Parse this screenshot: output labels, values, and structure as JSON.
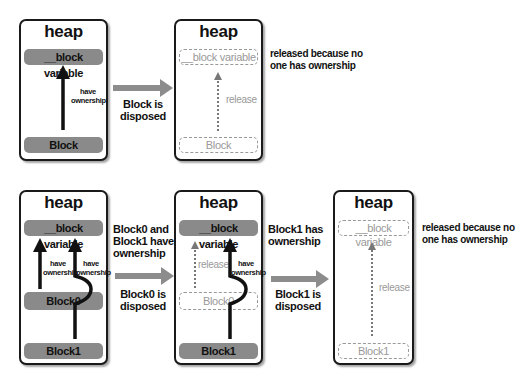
{
  "top_row": {
    "panel1": {
      "title": "heap",
      "variable": "__block variable",
      "block": "Block",
      "arrow_label": "have\nownership"
    },
    "transition": {
      "label_line1": "Block is",
      "label_line2": "disposed"
    },
    "panel2": {
      "title": "heap",
      "variable": "__block variable",
      "block": "Block",
      "arrow_label": "release",
      "note_line1": "released because no",
      "note_line2": "one has ownership"
    }
  },
  "bottom_row": {
    "panel1": {
      "title": "heap",
      "variable": "__block variable",
      "block0": "Block0",
      "block1": "Block1",
      "arrow0_label_1": "have",
      "arrow0_label_2": "ownership",
      "arrow1_label_1": "have",
      "arrow1_label_2": "ownership",
      "note_line1": "Block0 and",
      "note_line2": "Block1 have",
      "note_line3": "ownership"
    },
    "transition1": {
      "label_line1": "Block0 is",
      "label_line2": "disposed"
    },
    "panel2": {
      "title": "heap",
      "variable": "__block variable",
      "block0": "Block0",
      "block1": "Block1",
      "release_label": "release",
      "arrow1_label_1": "have",
      "arrow1_label_2": "ownership",
      "note_line1": "Block1 has",
      "note_line2": "ownership"
    },
    "transition2": {
      "label_line1": "Block1 is",
      "label_line2": "disposed"
    },
    "panel3": {
      "title": "heap",
      "variable": "__block variable",
      "block1": "Block1",
      "release_label": "release",
      "note_line1": "released because no",
      "note_line2": "one has ownership"
    }
  },
  "colors": {
    "solid_pill": "#8a8a8a",
    "ghost": "#999999",
    "arrow": "#8c8c8c",
    "border": "#1a1a1a"
  }
}
